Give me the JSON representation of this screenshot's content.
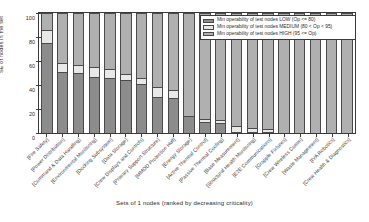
{
  "chart_data": {
    "type": "bar",
    "stacked": true,
    "title": "",
    "xlabel": "Sets of 1 nodes (ranked by decreasing criticality)",
    "ylabel": "SE of nodes in the set",
    "ylim": [
      0,
      100
    ],
    "yticks": [
      0,
      20,
      40,
      60,
      80,
      100
    ],
    "grid": false,
    "legend_position": "top-right",
    "categories": [
      "[Fire Safety]",
      "[Power Distribution]",
      "[Command & Data Handling]",
      "[Environmental Monitoring]",
      "[Docking Subsystem]",
      "[Data Storage]",
      "[Crew Displays and Controls]",
      "[Primary Support Structure]",
      "[MMOD Protection Hull]",
      "[Energy Storage]",
      "[Active Thermal Control]",
      "[Passive Thermal Cooling]",
      "[Base Measurement]",
      "[Structural Health Monitoring]",
      "[E2E Communications]",
      "[Grapple Fixtures]",
      "[Crew Wireless Comm]",
      "[Waste Management]",
      "[IVA Robotics]",
      "[Crew Health & Diagnostics]"
    ],
    "series": [
      {
        "name": "Min operability of test nodes LOW (Op <= 80)",
        "color": "#8c8c8c",
        "values": [
          75,
          51,
          50,
          47,
          46,
          44,
          41,
          30,
          29,
          14,
          9,
          8,
          1,
          1,
          1,
          0,
          0,
          0,
          0,
          0
        ]
      },
      {
        "name": "Min operability of test nodes MEDIUM (80 < Op < 95)",
        "color": "#e8e8e8",
        "values": [
          11,
          7,
          7,
          8,
          7,
          5,
          5,
          8,
          7,
          0,
          3,
          3,
          5,
          3,
          2,
          0,
          0,
          0,
          0,
          0
        ]
      },
      {
        "name": "Min operability of test nodes HIGH (95 <= Op)",
        "color": "#b0b0b0",
        "values": [
          14,
          42,
          43,
          45,
          47,
          51,
          54,
          62,
          64,
          86,
          88,
          89,
          94,
          96,
          97,
          100,
          100,
          100,
          100,
          100
        ]
      }
    ]
  },
  "legend": {
    "items": [
      "Min operability of test nodes LOW (Op <= 80)",
      "Min operability of test nodes MEDIUM (80 < Op < 95)",
      "Min operability of test nodes HIGH (95 <= Op)"
    ]
  },
  "axes": {
    "ylabel": "SE of nodes in the set",
    "xlabel": "Sets of 1 nodes (ranked by decreasing criticality)",
    "yticks": [
      "0",
      "20",
      "40",
      "60",
      "80",
      "100"
    ]
  },
  "colors": {
    "low": "#8c8c8c",
    "medium": "#e8e8e8",
    "high": "#b0b0b0",
    "axis": "#3a3a3a",
    "background": "#ffffff"
  }
}
